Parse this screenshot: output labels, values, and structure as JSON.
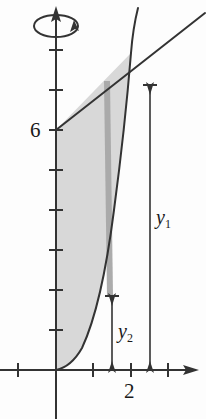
{
  "figure": {
    "background_color": "#fdfdfd",
    "stroke_color": "#333333",
    "shaded_region_color": "#d8d8d8",
    "shell_strip_color": "#a8a8a8"
  },
  "axes": {
    "x_axis": {
      "name": "x-axis",
      "origin_px": {
        "x": 56,
        "y": 370
      },
      "tick_spacing_px": 37.5,
      "ticks_px": [
        18,
        56,
        93,
        131,
        168
      ],
      "labels": [
        {
          "text": "2",
          "x_px": 131
        }
      ],
      "arrow": "right"
    },
    "y_axis": {
      "name": "y-axis",
      "tick_spacing_px": 40,
      "unit_px": 20,
      "ticks_px": [
        50,
        90,
        130,
        170,
        210,
        250,
        290,
        330
      ],
      "labels": [
        {
          "text": "6",
          "y_px": 130
        }
      ],
      "arrow": "up"
    }
  },
  "rotation_symbol": {
    "name": "axis-of-revolution-symbol",
    "description": "ellipse with arrowhead encircling the y-axis indicating rotation"
  },
  "curves": {
    "line": {
      "name": "straight-line",
      "y_intercept_value": 6,
      "start_px": {
        "x": 56,
        "y": 130
      },
      "end_px": {
        "x": 205,
        "y": 13
      }
    },
    "parabola": {
      "name": "curved-boundary",
      "start_px": {
        "x": 56,
        "y": 370
      },
      "end_px": {
        "x": 138,
        "y": 8
      }
    },
    "intersection_px": {
      "x": 131,
      "y": 53
    }
  },
  "shell": {
    "name": "representative-shell-strip",
    "x_px": 107,
    "top_px": 81,
    "bottom_px": 296
  },
  "dimensions": {
    "y1": {
      "label": "y",
      "subscript": "1",
      "x_px": 150,
      "top_px": 85,
      "bottom_px": 370
    },
    "y2": {
      "label": "y",
      "subscript": "2",
      "x_px": 112,
      "top_px": 296,
      "bottom_px": 370
    }
  },
  "labels": {
    "y_intercept": "6",
    "x_tick": "2",
    "y1_base": "y",
    "y1_sub": "1",
    "y2_base": "y",
    "y2_sub": "2"
  }
}
